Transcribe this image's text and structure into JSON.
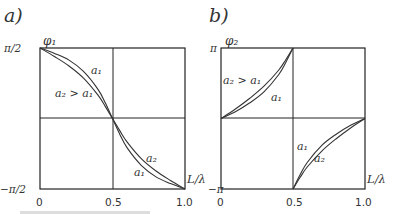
{
  "chart_data": [
    {
      "type": "line",
      "panel_label": "a)",
      "ylabel": "φ₁",
      "xlabel": "L/λ",
      "xlim": [
        0,
        1.0
      ],
      "ylim_labels": [
        "π/2",
        "−π/2"
      ],
      "ylim": [
        -1.5708,
        1.5708
      ],
      "x_ticks": [
        "0",
        "0.5",
        "1.0"
      ],
      "grid": true,
      "series": [
        {
          "name": "a1",
          "label": "a₁",
          "x": [
            0,
            0.1,
            0.2,
            0.3,
            0.4,
            0.45,
            0.5,
            0.55,
            0.6,
            0.7,
            0.8,
            0.9,
            1.0
          ],
          "y": [
            1.5708,
            1.45,
            1.3,
            1.05,
            0.65,
            0.35,
            0.0,
            -0.35,
            -0.65,
            -1.05,
            -1.3,
            -1.45,
            -1.5708
          ]
        },
        {
          "name": "a2",
          "label": "a₂",
          "x": [
            0,
            0.1,
            0.2,
            0.3,
            0.4,
            0.45,
            0.5,
            0.55,
            0.6,
            0.7,
            0.8,
            0.9,
            1.0
          ],
          "y": [
            1.5708,
            1.38,
            1.17,
            0.9,
            0.52,
            0.27,
            0.0,
            -0.27,
            -0.52,
            -0.9,
            -1.17,
            -1.38,
            -1.5708
          ]
        }
      ],
      "annotations": [
        {
          "text": "a₁",
          "near": "upper curve, upper-left quadrant"
        },
        {
          "text": "a₂ > a₁",
          "near": "upper-left quadrant"
        },
        {
          "text": "a₂",
          "near": "lower-right quadrant"
        },
        {
          "text": "a₁",
          "near": "lower-right quadrant"
        }
      ]
    },
    {
      "type": "line",
      "panel_label": "b)",
      "ylabel": "φ₂",
      "xlabel": "L/λ",
      "xlim": [
        0,
        1.0
      ],
      "ylim_labels": [
        "π",
        "−π"
      ],
      "ylim": [
        -3.1416,
        3.1416
      ],
      "x_ticks": [
        "0",
        "0.5",
        "1.0"
      ],
      "grid": true,
      "series": [
        {
          "name": "a1",
          "label": "a₁",
          "x": [
            0,
            0.1,
            0.2,
            0.3,
            0.4,
            0.45,
            0.5,
            0.5001,
            0.55,
            0.6,
            0.7,
            0.8,
            0.9,
            1.0
          ],
          "y": [
            0,
            0.3,
            0.7,
            1.2,
            1.95,
            2.5,
            3.1416,
            -3.1416,
            -2.5,
            -1.95,
            -1.2,
            -0.7,
            -0.3,
            0
          ]
        },
        {
          "name": "a2",
          "label": "a₂",
          "x": [
            0,
            0.1,
            0.2,
            0.3,
            0.4,
            0.45,
            0.5,
            0.5001,
            0.55,
            0.6,
            0.7,
            0.8,
            0.9,
            1.0
          ],
          "y": [
            0,
            0.42,
            0.9,
            1.45,
            2.15,
            2.62,
            3.1416,
            -3.1416,
            -2.62,
            -2.15,
            -1.45,
            -0.9,
            -0.42,
            0
          ]
        }
      ],
      "annotations": [
        {
          "text": "a₂ > a₁",
          "near": "upper-left quadrant"
        },
        {
          "text": "a₁",
          "near": "upper-left quadrant, below curves"
        },
        {
          "text": "a₁",
          "near": "lower-right quadrant"
        },
        {
          "text": "a₂",
          "near": "lower-right quadrant"
        }
      ]
    }
  ]
}
